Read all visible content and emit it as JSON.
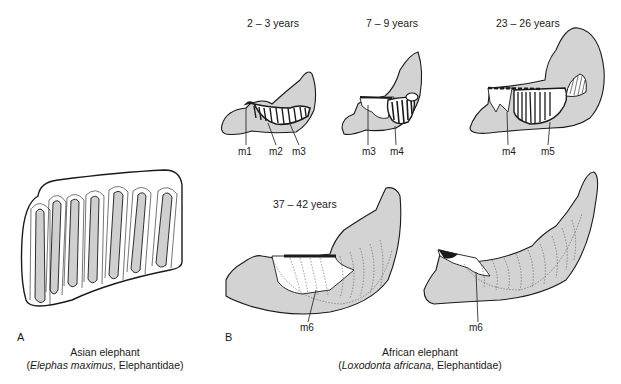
{
  "panel_a": {
    "letter": "A",
    "caption_line1": "Asian elephant",
    "caption_line2_open": "(",
    "caption_line2_italic": "Elephas maximus",
    "caption_line2_rest": ", Elephantidae)",
    "molar_plate_count": 7
  },
  "panel_b": {
    "letter": "B",
    "caption_line1": "African elephant",
    "caption_line2_open": "(",
    "caption_line2_italic": "Loxodonta africana",
    "caption_line2_rest": ", Elephantidae)",
    "stages": [
      {
        "age": "2 – 3 years",
        "labels": [
          "m1",
          "m2",
          "m3"
        ]
      },
      {
        "age": "7 – 9 years",
        "labels": [
          "m3",
          "m4"
        ]
      },
      {
        "age": "23 – 26 years",
        "labels": [
          "m4",
          "m5"
        ]
      },
      {
        "age": "37 – 42 years",
        "labels": [
          "m6"
        ]
      },
      {
        "age": "",
        "labels": [
          "m6"
        ]
      }
    ]
  },
  "colors": {
    "bone_fill": "#d3d3d3",
    "outline": "#1a1a1a",
    "tooth_fill": "#ffffff",
    "plate_fill": "#cfcfcf"
  }
}
